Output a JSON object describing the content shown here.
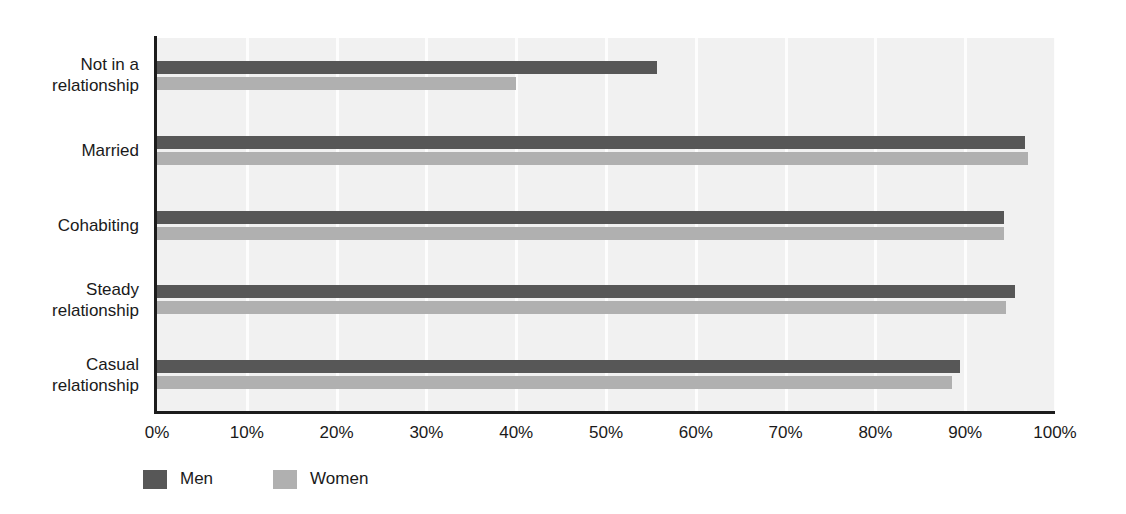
{
  "chart_data": {
    "type": "bar",
    "orientation": "horizontal",
    "title": "",
    "subtitle": "",
    "xlabel": "",
    "ylabel": "",
    "xlim": [
      0,
      100
    ],
    "grid": true,
    "legend_position": "bottom-left",
    "categories": [
      "Not in a\nrelationship",
      "Married",
      "Cohabiting",
      "Steady\nrelationship",
      "Casual\nrelationship"
    ],
    "tick_labels": [
      "0%",
      "10%",
      "20%",
      "30%",
      "40%",
      "50%",
      "60%",
      "70%",
      "80%",
      "90%",
      "100%"
    ],
    "tick_values": [
      0,
      10,
      20,
      30,
      40,
      50,
      60,
      70,
      80,
      90,
      100
    ],
    "series": [
      {
        "name": "Men",
        "color": "#575757",
        "values": [
          55.7,
          96.7,
          94.3,
          95.6,
          89.4
        ]
      },
      {
        "name": "Women",
        "color": "#b0b0b0",
        "values": [
          40.0,
          97.0,
          94.3,
          94.5,
          88.5
        ]
      }
    ]
  },
  "colors": {
    "plot_background": "#f1f1f1",
    "gridline": "#fdfdfd",
    "axis_line": "#1c1c1c",
    "text": "#1a1a1a",
    "men": "#575757",
    "women": "#b0b0b0"
  }
}
